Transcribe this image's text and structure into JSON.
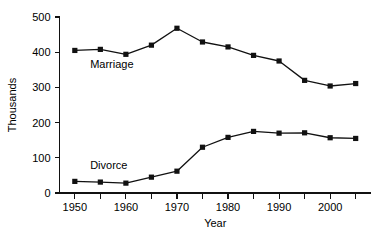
{
  "chart_data": {
    "type": "line",
    "title": "",
    "xlabel": "Year",
    "ylabel": "Thousands",
    "xlim": [
      1947,
      2008
    ],
    "ylim": [
      0,
      500
    ],
    "grid": false,
    "legend_position": "inline-annotations",
    "x": [
      1950,
      1955,
      1960,
      1965,
      1970,
      1975,
      1980,
      1985,
      1990,
      1995,
      2000,
      2005
    ],
    "xticks_major": [
      1950,
      1960,
      1970,
      1980,
      1990,
      2000
    ],
    "xticks_minor": [
      1955,
      1965,
      1975,
      1985,
      1995,
      2005
    ],
    "xtick_labels": [
      "1950",
      "1960",
      "1970",
      "1980",
      "1990",
      "2000"
    ],
    "yticks": [
      0,
      100,
      200,
      300,
      400,
      500
    ],
    "ytick_labels": [
      "0",
      "100",
      "200",
      "300",
      "400",
      "500"
    ],
    "series": [
      {
        "name": "Marriage",
        "label_x": 1953,
        "label_y": 355,
        "marker": "square",
        "color": "#111111",
        "values": [
          405,
          408,
          394,
          420,
          468,
          429,
          415,
          391,
          375,
          320,
          304,
          311
        ]
      },
      {
        "name": "Divorce",
        "label_x": 1953,
        "label_y": 68,
        "marker": "square",
        "color": "#111111",
        "values": [
          33,
          31,
          28,
          45,
          62,
          130,
          158,
          175,
          170,
          171,
          157,
          155
        ]
      }
    ]
  },
  "axes": {
    "x_title": "Year",
    "y_title": "Thousands"
  }
}
